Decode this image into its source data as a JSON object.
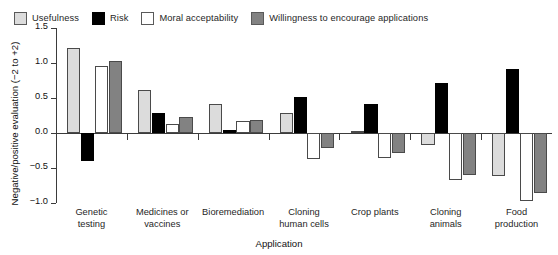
{
  "chart_data": {
    "type": "bar",
    "title": "",
    "xlabel": "Application",
    "ylabel": "Negative/positive evaluation (−2 to +2)",
    "ylim": [
      -1.0,
      1.5
    ],
    "yticks": [
      1.5,
      1.0,
      0.5,
      0.0,
      -0.5,
      -1.0
    ],
    "ytick_labels": [
      "1.5",
      "1.0",
      "0.5",
      "0.0",
      "−0.5",
      "−1.0"
    ],
    "grid": false,
    "legend_position": "top",
    "categories": [
      "Genetic testing",
      "Medicines or vaccines",
      "Bioremediation",
      "Cloning human cells",
      "Crop plants",
      "Cloning animals",
      "Food production"
    ],
    "category_lines": [
      [
        "Genetic",
        "testing"
      ],
      [
        "Medicines or",
        "vaccines"
      ],
      [
        "Bioremediation"
      ],
      [
        "Cloning",
        "human cells"
      ],
      [
        "Crop plants"
      ],
      [
        "Cloning",
        "animals"
      ],
      [
        "Food",
        "production"
      ]
    ],
    "series": [
      {
        "name": "Usefulness",
        "color": "#dcdcdc",
        "values": [
          1.21,
          0.61,
          0.41,
          0.29,
          0.03,
          -0.17,
          -0.62
        ]
      },
      {
        "name": "Risk",
        "color": "#000000",
        "values": [
          -0.4,
          0.29,
          0.04,
          0.51,
          0.42,
          0.72,
          0.91
        ]
      },
      {
        "name": "Moral acceptability",
        "color": "#ffffff",
        "values": [
          0.96,
          0.13,
          0.17,
          -0.37,
          -0.35,
          -0.67,
          -0.97
        ]
      },
      {
        "name": "Willingness to encourage applications",
        "color": "#828282",
        "values": [
          1.03,
          0.23,
          0.19,
          -0.22,
          -0.28,
          -0.6,
          -0.85
        ]
      }
    ]
  }
}
